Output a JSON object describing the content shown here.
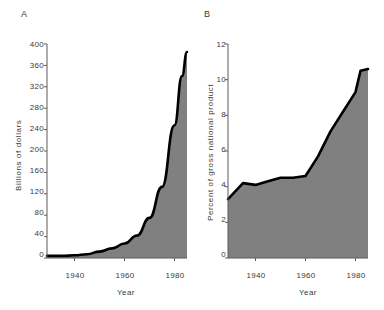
{
  "figure": {
    "background": "#ffffff",
    "fill_color": "#808080",
    "line_color": "#000000",
    "axis_color": "#5a5a5a"
  },
  "panels": [
    {
      "letter": "A",
      "xlabel": "Year",
      "ylabel": "Billions of dollars",
      "xticks": [
        "1940",
        "1960",
        "1980"
      ],
      "yticks": [
        "0",
        "40",
        "80",
        "120",
        "160",
        "200",
        "240",
        "280",
        "320",
        "360",
        "400"
      ]
    },
    {
      "letter": "B",
      "xlabel": "Year",
      "ylabel": "Percent of gross national product",
      "xticks": [
        "1940",
        "1960",
        "1980"
      ],
      "yticks": [
        "0",
        "2",
        "4",
        "6",
        "8",
        "10",
        "12"
      ]
    }
  ],
  "chart_data": [
    {
      "type": "area",
      "panel": "A",
      "title": "",
      "xlabel": "Year",
      "ylabel": "Billions of dollars",
      "xlim": [
        1929,
        1985
      ],
      "ylim": [
        0,
        400
      ],
      "xticks": [
        1940,
        1960,
        1980
      ],
      "yticks": [
        0,
        40,
        80,
        120,
        160,
        200,
        240,
        280,
        320,
        360,
        400
      ],
      "grid": false,
      "legend": "none",
      "x": [
        1929,
        1935,
        1940,
        1945,
        1950,
        1955,
        1960,
        1965,
        1970,
        1975,
        1980,
        1983,
        1985
      ],
      "values": [
        4,
        4,
        5,
        7,
        12,
        18,
        27,
        42,
        75,
        133,
        248,
        340,
        385
      ]
    },
    {
      "type": "area",
      "panel": "B",
      "title": "",
      "xlabel": "Year",
      "ylabel": "Percent of gross national product",
      "xlim": [
        1929,
        1985
      ],
      "ylim": [
        0,
        12
      ],
      "xticks": [
        1940,
        1960,
        1980
      ],
      "yticks": [
        0,
        2,
        4,
        6,
        8,
        10,
        12
      ],
      "grid": false,
      "legend": "none",
      "x": [
        1929,
        1935,
        1940,
        1945,
        1950,
        1955,
        1960,
        1965,
        1970,
        1975,
        1980,
        1982,
        1985
      ],
      "values": [
        3.3,
        4.2,
        4.1,
        4.3,
        4.5,
        4.5,
        4.6,
        5.7,
        7.1,
        8.2,
        9.3,
        10.5,
        10.6
      ]
    }
  ]
}
